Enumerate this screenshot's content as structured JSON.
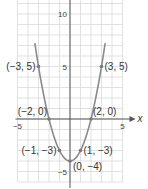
{
  "chart_data": {
    "type": "line",
    "title": "",
    "function": "y = x^2 - 4",
    "xlabel": "x",
    "ylabel": "",
    "xlim": [
      -5,
      5
    ],
    "ylim": [
      -6,
      11.3
    ],
    "grid": true,
    "x_ticks": [
      {
        "value": -5,
        "label": "−5"
      },
      {
        "value": 5,
        "label": "5"
      }
    ],
    "y_ticks": [
      {
        "value": 10,
        "label": "10"
      },
      {
        "value": 5,
        "label": "5"
      },
      {
        "value": -5,
        "label": "−5"
      }
    ],
    "series": [
      {
        "name": "parabola",
        "x": [
          -3.35,
          -3,
          -2,
          -1,
          0,
          1,
          2,
          3,
          3.35
        ],
        "y": [
          7.22,
          5,
          0,
          -3,
          -4,
          -3,
          0,
          5,
          7.22
        ]
      }
    ],
    "points": [
      {
        "x": -3,
        "y": 5,
        "label": "(−3, 5)",
        "anchor": "left"
      },
      {
        "x": 3,
        "y": 5,
        "label": "(3, 5)",
        "anchor": "right"
      },
      {
        "x": -2,
        "y": 0,
        "label": "(−2, 0)",
        "anchor": "left-above"
      },
      {
        "x": 2,
        "y": 0,
        "label": "(2, 0)",
        "anchor": "right-above"
      },
      {
        "x": -1,
        "y": -3,
        "label": "(−1, −3)",
        "anchor": "left"
      },
      {
        "x": 1,
        "y": -3,
        "label": "(1, −3)",
        "anchor": "right"
      },
      {
        "x": 0,
        "y": -4,
        "label": "(0, −4)",
        "anchor": "right-below"
      }
    ],
    "colors": {
      "curve": "#8a8a8a",
      "axis": "#555555",
      "grid": "#d9d9d9",
      "point": "#7a7a7a"
    }
  }
}
